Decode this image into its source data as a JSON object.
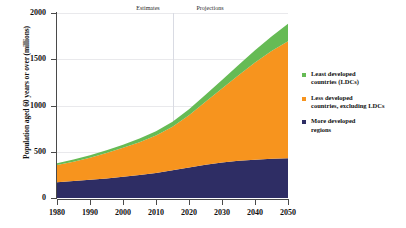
{
  "chart_data": {
    "type": "area",
    "stacked": true,
    "title": "",
    "xlabel": "",
    "ylabel": "Population aged 60 years or over (millions)",
    "xlim": [
      1980,
      2050
    ],
    "ylim": [
      0,
      2000
    ],
    "grid": true,
    "legend_position": "right",
    "yticks": [
      0,
      500,
      1000,
      1500,
      2000
    ],
    "xticks": [
      1980,
      1990,
      2000,
      2010,
      2020,
      2030,
      2040,
      2050
    ],
    "x": [
      1980,
      1985,
      1990,
      1995,
      2000,
      2005,
      2010,
      2015,
      2020,
      2025,
      2030,
      2035,
      2040,
      2045,
      2050
    ],
    "series": [
      {
        "name": "More developed regions",
        "color": "#2e2d64",
        "values": [
          170,
          183,
          196,
          212,
          230,
          248,
          271,
          300,
          330,
          360,
          385,
          402,
          414,
          423,
          430
        ]
      },
      {
        "name": "Less developed countries, excluding LDCs",
        "color": "#f7941e",
        "values": [
          186,
          210,
          239,
          274,
          312,
          354,
          405,
          470,
          565,
          680,
          800,
          925,
          1050,
          1165,
          1265
        ]
      },
      {
        "name": "Least developed countries (LDCs)",
        "color": "#66bb55",
        "values": [
          21,
          24,
          27,
          31,
          35,
          40,
          46,
          54,
          64,
          77,
          92,
          110,
          132,
          158,
          190
        ]
      }
    ],
    "annotations": [
      {
        "text": "Estimates",
        "x": 1998,
        "position": "top"
      },
      {
        "text": "Projections",
        "x": 2026,
        "position": "top"
      }
    ],
    "divider": {
      "x": 2015,
      "color": "#d9dbe3"
    }
  },
  "legend": {
    "items": [
      {
        "label_line1": "Least developed",
        "label_line2": "countries (LDCs)",
        "color": "#66bb55"
      },
      {
        "label_line1": "Less developed",
        "label_line2": "countries, excluding LDCs",
        "color": "#f7941e"
      },
      {
        "label_line1": "More developed",
        "label_line2": "regions",
        "color": "#2e2d64"
      }
    ]
  },
  "axis": {
    "y_title": "Population aged 60 years or over (millions)",
    "y_labels": [
      "2000",
      "1500",
      "1000",
      "500",
      "0"
    ],
    "x_labels": [
      "1980",
      "1990",
      "2000",
      "2010",
      "2020",
      "2030",
      "2040",
      "2050"
    ]
  },
  "annotations": {
    "estimates": "Estimates",
    "projections": "Projections"
  }
}
